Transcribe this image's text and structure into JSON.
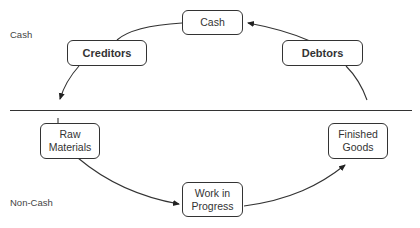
{
  "diagram": {
    "regions": {
      "cash_label": "Cash",
      "noncash_label": "Non-Cash"
    },
    "nodes": {
      "cash": {
        "label": "Cash"
      },
      "creditors": {
        "label": "Creditors"
      },
      "debtors": {
        "label": "Debtors"
      },
      "raw_materials": {
        "line1": "Raw",
        "line2": "Materials"
      },
      "work_in_progress": {
        "line1": "Work in",
        "line2": "Progress"
      },
      "finished_goods": {
        "line1": "Finished",
        "line2": "Goods"
      }
    },
    "edges": [
      {
        "from": "Cash",
        "to": "Creditors"
      },
      {
        "from": "Creditors",
        "to": "Raw Materials"
      },
      {
        "from": "Raw Materials",
        "to": "Work in Progress"
      },
      {
        "from": "Work in Progress",
        "to": "Finished Goods"
      },
      {
        "from": "Finished Goods",
        "to": "Debtors"
      },
      {
        "from": "Debtors",
        "to": "Cash"
      }
    ],
    "colors": {
      "stroke": "#333333",
      "background": "#ffffff",
      "text": "#333333"
    }
  }
}
